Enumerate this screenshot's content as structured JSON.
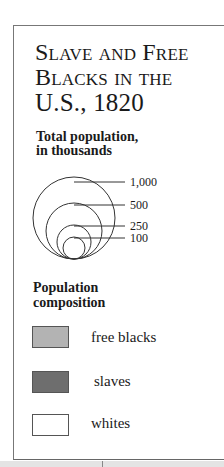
{
  "title": {
    "lines": [
      "Slave and Free",
      "Blacks in the",
      "U.S., 1820"
    ]
  },
  "size_legend": {
    "heading_lines": [
      "Total population,",
      "in thousands"
    ],
    "circles": [
      {
        "label": "1,000",
        "value": 1000
      },
      {
        "label": "500",
        "value": 500
      },
      {
        "label": "250",
        "value": 250
      },
      {
        "label": "100",
        "value": 100
      }
    ]
  },
  "composition_legend": {
    "heading_lines": [
      "Population",
      "composition"
    ],
    "items": [
      {
        "label": "free blacks",
        "color": "#b3b3b3"
      },
      {
        "label": "slaves",
        "color": "#6e6e6e"
      },
      {
        "label": "whites",
        "color": "#ffffff"
      }
    ]
  }
}
